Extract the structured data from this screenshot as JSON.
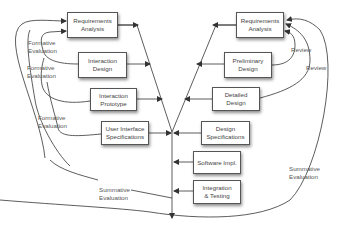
{
  "diagram": {
    "type": "V-model with iterative formative and summative evaluation",
    "left_boxes": [
      {
        "label_line1": "Requirements",
        "label_line2": "Analysis"
      },
      {
        "label_line1": "Interaction",
        "label_line2": "Design"
      },
      {
        "label_line1": "Interaction",
        "label_line2": "Prototype"
      },
      {
        "label_line1": "User Interface",
        "label_line2": "Specifications"
      }
    ],
    "right_boxes": [
      {
        "label_line1": "Requirements",
        "label_line2": "Analysis"
      },
      {
        "label_line1": "Preliminary",
        "label_line2": "Design"
      },
      {
        "label_line1": "Detailed",
        "label_line2": "Design"
      },
      {
        "label_line1": "Design",
        "label_line2": "Specifications"
      },
      {
        "label_line1": "Software Impl.",
        "label_line2": ""
      },
      {
        "label_line1": "Integration",
        "label_line2": "& Testing"
      }
    ],
    "left_labels": [
      {
        "line1": "Formative",
        "line2": "Evaluation"
      },
      {
        "line1": "Formative",
        "line2": "Evaluation"
      },
      {
        "line1": "Formative",
        "line2": "Evaluation"
      },
      {
        "line1": "Summative",
        "line2": "Evaluation"
      }
    ],
    "right_labels": [
      {
        "line1": "Review",
        "line2": ""
      },
      {
        "line1": "Review",
        "line2": ""
      },
      {
        "line1": "Summative",
        "line2": "Evaluation"
      }
    ],
    "colors": {
      "line": "#333333",
      "box_border": "#555555",
      "text": "#444444"
    }
  }
}
